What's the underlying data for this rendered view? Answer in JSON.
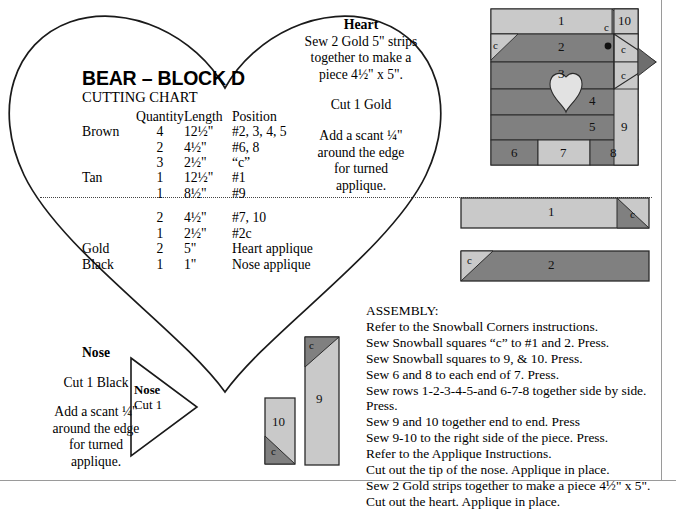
{
  "title": "BEAR – BLOCK D",
  "cutting_chart": {
    "label": "CUTTING CHART",
    "headers": {
      "color": "",
      "quantity": "Quantity",
      "length": "Length",
      "position": "Position"
    },
    "rows": [
      {
        "color": "Brown",
        "quantity": "4",
        "length": "12½\"",
        "position": "#2, 3, 4, 5"
      },
      {
        "color": "",
        "quantity": "2",
        "length": "4½\"",
        "position": "#6, 8"
      },
      {
        "color": "",
        "quantity": "3",
        "length": "2½\"",
        "position": "“c”"
      },
      {
        "color": "Tan",
        "quantity": "1",
        "length": "12½\"",
        "position": "#1"
      },
      {
        "color": "",
        "quantity": "1",
        "length": "8½\"",
        "position": "#9"
      },
      {
        "color": "",
        "quantity": "2",
        "length": "4½\"",
        "position": "#7, 10"
      },
      {
        "color": "",
        "quantity": "1",
        "length": "2½\"",
        "position": "#2c"
      },
      {
        "color": "Gold",
        "quantity": "2",
        "length": "5\"",
        "position": "Heart applique"
      },
      {
        "color": "Black",
        "quantity": "1",
        "length": "1\"",
        "position": "Nose applique"
      }
    ]
  },
  "heart_note": {
    "title": "Heart",
    "line1": "Sew 2 Gold 5\" strips",
    "line2": "together to make a",
    "line3": "piece 4½\" x 5\".",
    "cut": "Cut 1 Gold",
    "seam1": "Add a scant ¼\"",
    "seam2": "around the edge",
    "seam3": "for turned",
    "seam4": "applique."
  },
  "nose_note": {
    "title": "Nose",
    "cut": "Cut 1 Black",
    "seam1": "Add a scant ¼\"",
    "seam2": "around the edge",
    "seam3": "for turned",
    "seam4": "applique."
  },
  "nose_template": {
    "title": "Nose",
    "cut": "Cut 1"
  },
  "assembly": {
    "heading": "ASSEMBLY:",
    "steps": [
      "Refer to the Snowball Corners instructions.",
      "Sew Snowball squares “c” to #1 and 2. Press.",
      "Sew Snowball squares to 9, & 10. Press.",
      "Sew 6 and 8 to each end of 7. Press.",
      "Sew rows 1-2-3-4-5-and 6-7-8 together side by side.  Press.",
      "Sew 9 and 10 together end to end. Press",
      "Sew 9-10 to the right side of the piece. Press.",
      "Refer to the Applique Instructions.",
      "Cut out the tip of the nose. Applique in place.",
      "Sew 2 Gold strips together to make a piece 4½\" x 5\".",
      "Cut out the heart. Applique in place."
    ]
  },
  "block_diagram": {
    "name": "bear-block-d-assembled",
    "piece_labels": {
      "p1": "1",
      "p2": "2",
      "p3": "3",
      "p4": "4",
      "p5": "5",
      "p6": "6",
      "p7": "7",
      "p8": "8",
      "p9": "9",
      "p10": "10",
      "c_top_right": "c",
      "c_left": "c",
      "c_nose_upper": "c",
      "c_nose_lower": "c"
    }
  },
  "strip_diagrams": [
    {
      "name": "strip-1",
      "label": "1",
      "corner_label": "c",
      "body": "tan",
      "corner": "brown",
      "corner_side": "right"
    },
    {
      "name": "strip-2",
      "label": "2",
      "corner_label": "c",
      "body": "brown",
      "corner": "tan",
      "corner_side": "left"
    }
  ],
  "small_pieces": [
    {
      "name": "piece-10",
      "label": "10",
      "corner_label": "c",
      "body": "tan",
      "corner": "brown",
      "corner_side": "bottom-left"
    },
    {
      "name": "piece-9",
      "label": "9",
      "corner_label": "c",
      "body": "tan",
      "corner": "brown",
      "corner_side": "top-left"
    }
  ],
  "colors": {
    "tan": "#c9c9c9",
    "brown": "#808080",
    "gold": "#d9d9d9",
    "outline": "#1a1a1a",
    "page_bg": "#ffffff",
    "rule": "#9a9a9a"
  }
}
